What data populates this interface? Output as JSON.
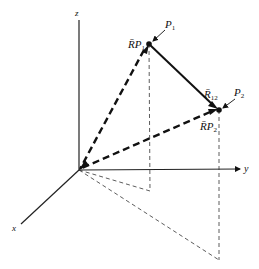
{
  "diagram": {
    "type": "3d-vector-diagram",
    "axes": {
      "x_label": "x",
      "y_label": "y",
      "z_label": "z"
    },
    "points": [
      {
        "name": "P",
        "sub": "1"
      },
      {
        "name": "P",
        "sub": "2"
      }
    ],
    "vectors": [
      {
        "name": "R̄P",
        "sub": "1",
        "style": "dashed-bold",
        "from": "origin",
        "to": "P1"
      },
      {
        "name": "R̄P",
        "sub": "2",
        "style": "dashed-bold",
        "from": "origin",
        "to": "P2"
      },
      {
        "name": "R̄",
        "sub": "12",
        "style": "solid-bold",
        "from": "P1",
        "to": "P2"
      }
    ],
    "projections": "thin dashed lines from points to xy-plane and back to origin",
    "colors": {
      "ink": "#111111",
      "background": "#ffffff"
    }
  }
}
